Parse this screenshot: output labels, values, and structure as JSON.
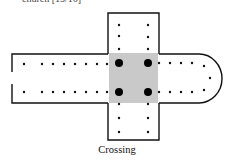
{
  "header": {
    "text": "church [15/16]"
  },
  "diagram": {
    "stroke_color": "#111111",
    "crossing_fill": "#c8c8c8",
    "caption": "Crossing"
  }
}
